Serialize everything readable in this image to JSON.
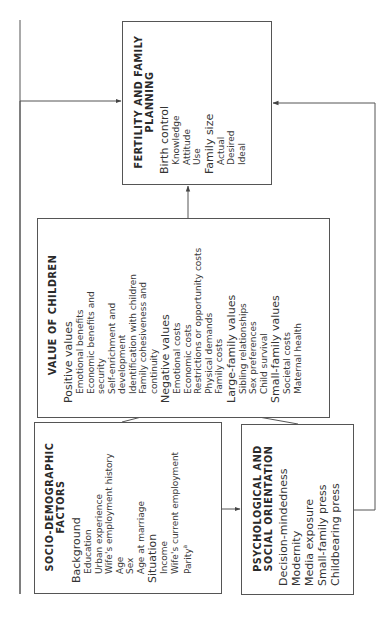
{
  "fertility": {
    "title_line1": "FERTILITY AND FAMILY",
    "title_line2": "PLANNING",
    "groups": [
      {
        "label": "Birth control",
        "items": [
          "Knowledge",
          "Attitude",
          "Use"
        ]
      },
      {
        "label": "Family size",
        "items": [
          "Actual",
          "Desired",
          "Ideal"
        ]
      }
    ]
  },
  "value_of_children": {
    "title": "VALUE OF CHILDREN",
    "groups": [
      {
        "label": "Positive values",
        "items": [
          "Emotional benefits",
          "Economic benefits and security",
          "Self-enrichment and development",
          "Identification with children",
          "Family cohesiveness and continuity"
        ]
      },
      {
        "label": "Negative values",
        "items": [
          "Emotional costs",
          "Economic costs",
          "Restrictions or opportunity costs",
          "Physical demands",
          "Family costs"
        ]
      },
      {
        "label": "Large-family values",
        "items": [
          "Sibling relationships",
          "Sex preferences",
          "Child survival"
        ]
      },
      {
        "label": "Small-family values",
        "items": [
          "Societal costs",
          "Maternal health"
        ]
      }
    ]
  },
  "socio_demographic": {
    "title_line1": "SOCIO-DEMOGRAPHIC",
    "title_line2": "FACTORS",
    "groups": [
      {
        "label": "Background",
        "items": [
          "Education",
          "Urban experience",
          "Wife's employment history",
          "Age",
          "Sex",
          "Age at marriage"
        ]
      },
      {
        "label": "Situation",
        "items": [
          "Income",
          "Wife's current employment",
          "Parity"
        ]
      }
    ],
    "parity_footnote_mark": "a"
  },
  "psych_social": {
    "title_line1": "PSYCHOLOGICAL AND",
    "title_line2": "SOCIAL ORIENTATION",
    "items": [
      "Decision-mindedness",
      "Modernity",
      "Media exposure",
      "Small-family press",
      "Childbearing press"
    ]
  },
  "connections": [
    {
      "from": "socio_demographic",
      "to": "psych_social"
    },
    {
      "from": "socio_demographic",
      "to": "value_of_children"
    },
    {
      "from": "psych_social",
      "to": "value_of_children"
    },
    {
      "from": "value_of_children",
      "to": "fertility"
    },
    {
      "from": "socio_demographic",
      "to": "fertility"
    },
    {
      "from": "psych_social",
      "to": "fertility"
    }
  ],
  "colors": {
    "line": "#555555",
    "text": "#2a2a2a",
    "background": "#ffffff"
  }
}
